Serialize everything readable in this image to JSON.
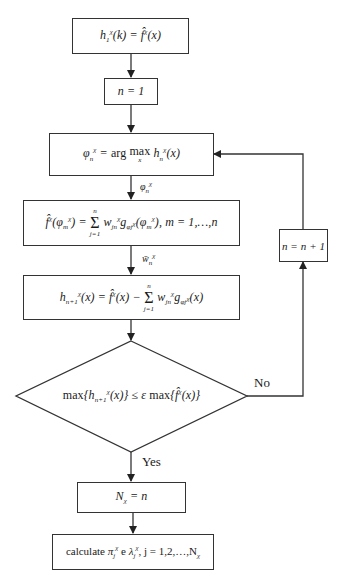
{
  "diagram": {
    "type": "flowchart",
    "nodes": [
      {
        "id": "init",
        "shape": "rect",
        "text": "h₁^χ(k) = f̂^χ(x)"
      },
      {
        "id": "n1",
        "shape": "rect",
        "text": "n = 1"
      },
      {
        "id": "argmax",
        "shape": "rect",
        "text": "φ_n^χ = arg max_x h_n^χ(x)"
      },
      {
        "id": "solve",
        "shape": "rect",
        "text": "f̂^χ(φ_m^χ) = Σ_{j=1}^{n} w_{jn}^χ g_{φj^χ}(φ_m^χ), m = 1,…,n"
      },
      {
        "id": "residual",
        "shape": "rect",
        "text": "h_{n+1}^χ(x) = f̂^χ(x) − Σ_{j=1}^{n} w_{jn}^χ g_{φj^χ}(x)"
      },
      {
        "id": "check",
        "shape": "diamond",
        "text": "max{h_{n+1}^χ(x)} ≤ ε max{f̂^χ(x)}"
      },
      {
        "id": "incr",
        "shape": "rect",
        "text": "n = n + 1"
      },
      {
        "id": "nchi",
        "shape": "rect",
        "text": "N_χ = n"
      },
      {
        "id": "calc",
        "shape": "rect",
        "text": "calculate π_j^χ e λ_j^χ, j = 1,2,…,N_χ"
      }
    ],
    "edges": [
      {
        "from": "init",
        "to": "n1",
        "label": ""
      },
      {
        "from": "n1",
        "to": "argmax",
        "label": ""
      },
      {
        "from": "argmax",
        "to": "solve",
        "label": "φ_n^χ"
      },
      {
        "from": "solve",
        "to": "residual",
        "label": "w̄_n^χ"
      },
      {
        "from": "residual",
        "to": "check",
        "label": ""
      },
      {
        "from": "check",
        "to": "incr",
        "label": "No"
      },
      {
        "from": "incr",
        "to": "argmax",
        "label": ""
      },
      {
        "from": "check",
        "to": "nchi",
        "label": "Yes"
      },
      {
        "from": "nchi",
        "to": "calc",
        "label": ""
      }
    ]
  },
  "labels": {
    "no": "No",
    "yes": "Yes",
    "calc_prefix": "calculate",
    "arg": "arg",
    "max": "max",
    "e": "e"
  },
  "colors": {
    "line": "#333333",
    "text": "#1a1a1a",
    "background": "#ffffff"
  }
}
